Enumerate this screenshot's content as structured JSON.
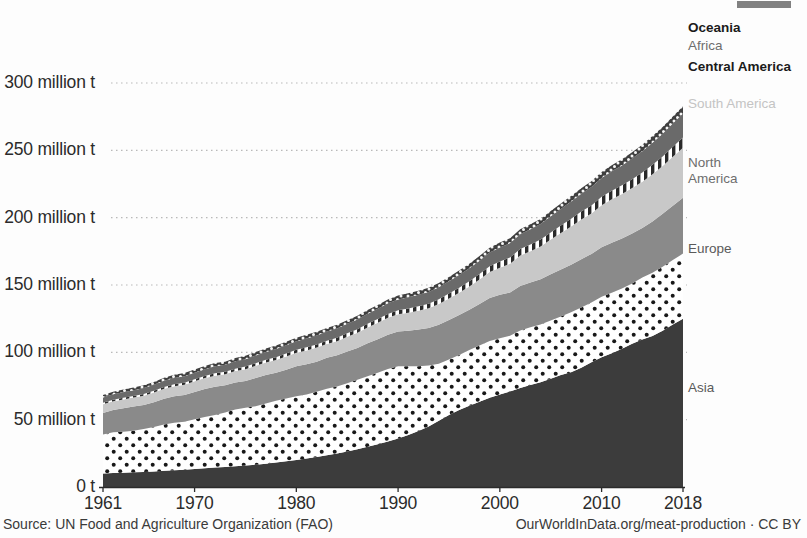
{
  "footer": {
    "source": "Source: UN Food and Agriculture Organization (FAO)",
    "attribution": "OurWorldInData.org/meat-production · CC BY"
  },
  "axes": {
    "y_ticks": [
      {
        "value": 0,
        "label": "0 t"
      },
      {
        "value": 50,
        "label": "50 million t"
      },
      {
        "value": 100,
        "label": "100 million t"
      },
      {
        "value": 150,
        "label": "150 million t"
      },
      {
        "value": 200,
        "label": "200 million t"
      },
      {
        "value": 250,
        "label": "250 million t"
      },
      {
        "value": 300,
        "label": "300 million t"
      }
    ],
    "x_ticks": [
      {
        "value": 1961,
        "label": "1961"
      },
      {
        "value": 1970,
        "label": "1970"
      },
      {
        "value": 1980,
        "label": "1980"
      },
      {
        "value": 1990,
        "label": "1990"
      },
      {
        "value": 2000,
        "label": "2000"
      },
      {
        "value": 2010,
        "label": "2010"
      },
      {
        "value": 2018,
        "label": "2018"
      }
    ]
  },
  "legend": [
    {
      "name": "Oceania",
      "label": "Oceania",
      "y": 20,
      "style": "legend-dark"
    },
    {
      "name": "Africa",
      "label": "Africa",
      "y": 38,
      "style": "legend-mid"
    },
    {
      "name": "Central America",
      "label": "Central America",
      "y": 59,
      "style": "legend-dark"
    },
    {
      "name": "South America",
      "label": "South America",
      "y": 96,
      "style": "legend-light"
    },
    {
      "name": "North America",
      "label": "North America",
      "y": 155,
      "style": "legend-mid"
    },
    {
      "name": "Europe",
      "label": "Europe",
      "y": 241,
      "style": "legend-plain"
    },
    {
      "name": "Asia",
      "label": "Asia",
      "y": 380,
      "style": "legend-plain"
    }
  ],
  "chart_data": {
    "type": "area",
    "title": "",
    "xlabel": "",
    "ylabel": "",
    "stacked": true,
    "grid": true,
    "legend_position": "right-inline",
    "xlim": [
      1961,
      2018
    ],
    "ylim": [
      0,
      320
    ],
    "y_unit": "million tonnes",
    "colors": {
      "Asia": "#3c3c3c",
      "Europe": "#ffffff",
      "North America": "#8a8a8a",
      "South America": "#c8c8c8",
      "Central America": "#ffffff",
      "Africa": "#6a6a6a",
      "Oceania": "#3f3f3f"
    },
    "patterns": {
      "Asia": "solid-dark",
      "Europe": "white-with-dark-dots",
      "North America": "solid-mid-gray",
      "South America": "solid-light-gray",
      "Central America": "vertical-hatch",
      "Africa": "solid-dark-gray",
      "Oceania": "dark-with-white-dots"
    },
    "x": [
      1961,
      1962,
      1963,
      1964,
      1965,
      1966,
      1967,
      1968,
      1969,
      1970,
      1971,
      1972,
      1973,
      1974,
      1975,
      1976,
      1977,
      1978,
      1979,
      1980,
      1981,
      1982,
      1983,
      1984,
      1985,
      1986,
      1987,
      1988,
      1989,
      1990,
      1991,
      1992,
      1993,
      1994,
      1995,
      1996,
      1997,
      1998,
      1999,
      2000,
      2001,
      2002,
      2003,
      2004,
      2005,
      2006,
      2007,
      2008,
      2009,
      2010,
      2011,
      2012,
      2013,
      2014,
      2015,
      2016,
      2017,
      2018
    ],
    "series": [
      {
        "name": "Asia",
        "values": [
          10.0,
          10.4,
          10.6,
          11.0,
          11.2,
          11.6,
          12.1,
          12.5,
          12.9,
          13.4,
          13.9,
          14.4,
          14.9,
          15.4,
          15.9,
          16.6,
          17.3,
          18.2,
          19.1,
          20.1,
          21.2,
          22.3,
          23.5,
          24.9,
          26.4,
          28.0,
          29.8,
          31.8,
          33.8,
          36.0,
          38.7,
          41.6,
          45.0,
          49.2,
          53.4,
          57.1,
          60.4,
          63.3,
          66.3,
          68.7,
          70.9,
          73.6,
          75.8,
          77.8,
          80.4,
          83.1,
          85.2,
          88.6,
          92.6,
          96.4,
          99.3,
          102.6,
          106.3,
          109.6,
          112.2,
          116.1,
          120.7,
          125.0
        ]
      },
      {
        "name": "Europe",
        "values": [
          29.0,
          30.2,
          30.5,
          30.8,
          31.8,
          33.0,
          34.3,
          35.3,
          35.5,
          36.9,
          38.1,
          39.1,
          40.4,
          42.1,
          43.0,
          43.4,
          44.7,
          45.9,
          46.7,
          47.3,
          47.5,
          48.4,
          49.5,
          49.8,
          50.7,
          51.6,
          52.4,
          53.1,
          53.8,
          53.6,
          50.9,
          48.0,
          45.2,
          42.4,
          41.3,
          41.0,
          41.4,
          41.8,
          42.2,
          41.8,
          41.5,
          42.7,
          42.9,
          42.8,
          43.3,
          43.5,
          44.5,
          44.6,
          44.4,
          44.8,
          45.0,
          44.8,
          44.9,
          46.0,
          46.9,
          47.5,
          47.8,
          48.3
        ]
      },
      {
        "name": "North America",
        "values": [
          16.0,
          16.5,
          17.3,
          17.9,
          17.8,
          18.3,
          19.1,
          19.6,
          19.9,
          20.3,
          20.8,
          20.9,
          20.2,
          20.1,
          19.9,
          21.0,
          21.2,
          20.7,
          21.3,
          22.2,
          22.5,
          22.4,
          22.9,
          23.1,
          23.6,
          23.6,
          24.5,
          24.8,
          25.4,
          25.8,
          26.4,
          27.3,
          27.9,
          28.9,
          29.3,
          29.6,
          29.8,
          30.8,
          31.8,
          32.2,
          32.1,
          33.0,
          33.1,
          33.6,
          34.2,
          34.9,
          35.3,
          36.0,
          36.1,
          36.8,
          37.1,
          37.2,
          37.1,
          36.8,
          38.1,
          39.4,
          40.3,
          41.5
        ]
      },
      {
        "name": "South America",
        "values": [
          6.4,
          6.5,
          6.6,
          6.7,
          7.0,
          7.2,
          7.4,
          7.5,
          7.7,
          7.9,
          8.1,
          8.3,
          8.3,
          8.5,
          8.7,
          9.0,
          9.3,
          9.5,
          9.8,
          10.0,
          10.2,
          10.4,
          10.3,
          10.5,
          10.8,
          11.3,
          11.8,
          12.2,
          12.6,
          12.8,
          13.4,
          14.0,
          14.6,
          15.3,
          16.0,
          16.6,
          17.3,
          18.2,
          19.4,
          20.2,
          21.2,
          22.6,
          23.3,
          24.3,
          25.8,
          27.1,
          28.5,
          29.4,
          30.0,
          31.3,
          32.3,
          32.9,
          33.7,
          34.3,
          35.1,
          35.3,
          36.5,
          37.1
        ]
      },
      {
        "name": "Central America",
        "values": [
          1.1,
          1.1,
          1.2,
          1.2,
          1.3,
          1.3,
          1.4,
          1.4,
          1.5,
          1.5,
          1.6,
          1.7,
          1.7,
          1.8,
          1.9,
          1.9,
          2.0,
          2.1,
          2.2,
          2.3,
          2.4,
          2.4,
          2.4,
          2.5,
          2.6,
          2.6,
          2.7,
          2.8,
          2.9,
          3.0,
          3.2,
          3.3,
          3.4,
          3.6,
          3.7,
          3.7,
          3.9,
          4.1,
          4.3,
          4.5,
          4.7,
          4.8,
          5.0,
          5.2,
          5.3,
          5.5,
          5.7,
          5.9,
          6.0,
          6.2,
          6.3,
          6.5,
          6.6,
          6.8,
          7.0,
          7.2,
          7.4,
          7.6
        ]
      },
      {
        "name": "Africa",
        "values": [
          4.0,
          4.1,
          4.2,
          4.3,
          4.4,
          4.5,
          4.6,
          4.7,
          4.8,
          4.9,
          5.0,
          5.2,
          5.3,
          5.4,
          5.5,
          5.7,
          5.8,
          6.0,
          6.1,
          6.3,
          6.5,
          6.6,
          6.8,
          6.9,
          7.1,
          7.3,
          7.5,
          7.7,
          7.9,
          8.1,
          8.3,
          8.5,
          8.7,
          8.9,
          9.1,
          9.4,
          9.6,
          9.9,
          10.1,
          10.4,
          10.7,
          11.0,
          11.3,
          11.6,
          12.0,
          12.4,
          12.8,
          13.2,
          13.6,
          14.0,
          14.4,
          14.8,
          15.3,
          15.8,
          16.3,
          16.8,
          17.3,
          17.8
        ]
      },
      {
        "name": "Oceania",
        "values": [
          1.9,
          1.9,
          2.0,
          2.0,
          2.0,
          2.1,
          2.2,
          2.3,
          2.3,
          2.4,
          2.4,
          2.4,
          2.3,
          2.4,
          2.5,
          2.6,
          2.6,
          2.7,
          2.7,
          2.6,
          2.7,
          2.7,
          2.6,
          2.7,
          2.7,
          2.8,
          2.8,
          2.8,
          2.9,
          2.9,
          3.0,
          3.1,
          3.1,
          3.2,
          3.2,
          3.3,
          3.4,
          3.5,
          3.6,
          3.7,
          3.7,
          3.7,
          3.7,
          3.8,
          3.9,
          4.0,
          4.1,
          4.2,
          4.3,
          4.4,
          4.5,
          4.6,
          4.7,
          4.8,
          5.0,
          5.1,
          5.2,
          5.4
        ]
      }
    ]
  }
}
